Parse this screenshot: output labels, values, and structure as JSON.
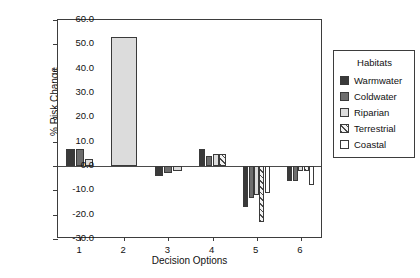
{
  "chart_data": {
    "type": "bar",
    "title": "",
    "xlabel": "Decision Options",
    "ylabel": "% Risk Change",
    "categories": [
      "1",
      "2",
      "3",
      "4",
      "5",
      "6"
    ],
    "ylim": [
      -30.0,
      60.0
    ],
    "yticks": [
      "60.0",
      "50.0",
      "40.0",
      "30.0",
      "20.0",
      "10.0",
      "0.0",
      "-10.0",
      "-20.0",
      "-30.0"
    ],
    "ytick_values": [
      60.0,
      50.0,
      40.0,
      30.0,
      20.0,
      10.0,
      0.0,
      -10.0,
      -20.0,
      -30.0
    ],
    "grid": false,
    "legend_position": "right-outside",
    "legend_title": "Habitats",
    "series": [
      {
        "name": "Warmwater",
        "color": "#3a3a3a",
        "pattern": "solid-dark",
        "values": [
          7.0,
          null,
          -4.0,
          7.0,
          -17.0,
          -6.0
        ]
      },
      {
        "name": "Coldwater",
        "color": "#6e6e6e",
        "pattern": "solid-medium",
        "values": [
          7.0,
          null,
          -3.0,
          4.0,
          -13.0,
          -6.0
        ]
      },
      {
        "name": "Riparian",
        "color": "#dcdcdc",
        "pattern": "solid-light",
        "values": [
          3.0,
          53.0,
          -2.0,
          5.0,
          -12.0,
          -2.0
        ]
      },
      {
        "name": "Terrestrial",
        "color": "#f2f2f2",
        "pattern": "diagonal-hatch",
        "values": [
          null,
          null,
          null,
          5.0,
          -23.0,
          -2.0
        ]
      },
      {
        "name": "Coastal",
        "color": "#ffffff",
        "pattern": "solid-white",
        "values": [
          null,
          null,
          null,
          null,
          -11.0,
          -8.0
        ]
      }
    ]
  },
  "axes": {
    "y_title": "% Risk Change",
    "x_title": "Decision Options"
  },
  "legend": {
    "title": "Habitats",
    "items": [
      {
        "label": "Warmwater",
        "swatch": "swatch-solid-dark"
      },
      {
        "label": "Coldwater",
        "swatch": "swatch-solid-medium"
      },
      {
        "label": "Riparian",
        "swatch": "swatch-solid-light"
      },
      {
        "label": "Terrestrial",
        "swatch": "swatch-diagonal-hatch"
      },
      {
        "label": "Coastal",
        "swatch": "swatch-solid-white"
      }
    ]
  },
  "colors": {
    "warmwater": "#3a3a3a",
    "coldwater": "#6e6e6e",
    "riparian": "#dcdcdc",
    "terrestrial": "#f2f2f2",
    "coastal": "#ffffff",
    "axis": "#3d3d3d",
    "background": "#ffffff"
  }
}
